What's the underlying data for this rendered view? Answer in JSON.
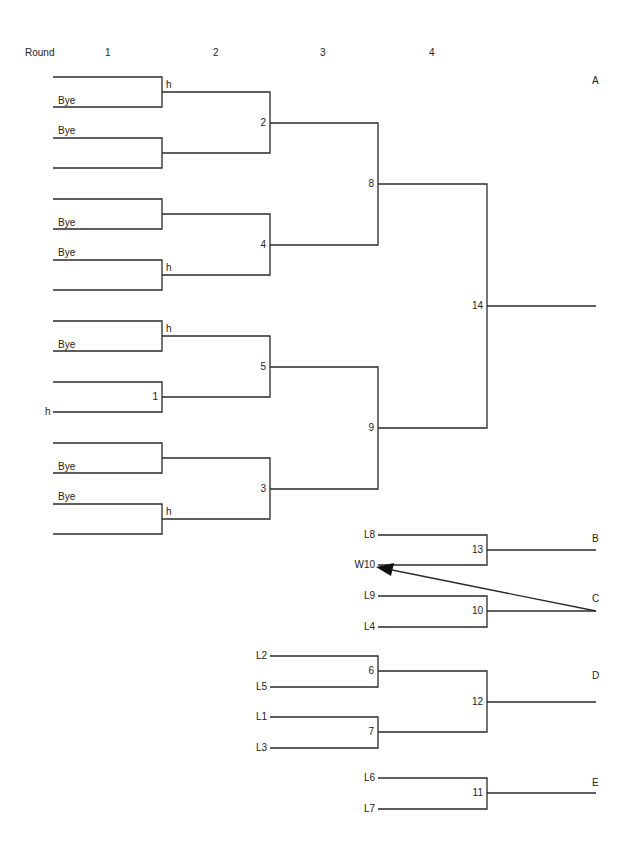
{
  "header": {
    "round_label": "Round",
    "rounds": [
      "1",
      "2",
      "3",
      "4"
    ]
  },
  "brackets": {
    "A": "A",
    "B": "B",
    "C": "C",
    "D": "D",
    "E": "E"
  },
  "labels": {
    "bye": "Bye",
    "h": "h",
    "match_numbers": {
      "m1": "1",
      "m2": "2",
      "m3": "3",
      "m4": "4",
      "m5": "5",
      "m6": "6",
      "m7": "7",
      "m8": "8",
      "m9": "9",
      "m10": "10",
      "m11": "11",
      "m12": "12",
      "m13": "13",
      "m14": "14"
    },
    "losers": {
      "L8": "L8",
      "W10": "W10",
      "L9": "L9",
      "L4": "L4",
      "L2": "L2",
      "L5": "L5",
      "L1": "L1",
      "L3": "L3",
      "L6": "L6",
      "L7": "L7"
    }
  }
}
